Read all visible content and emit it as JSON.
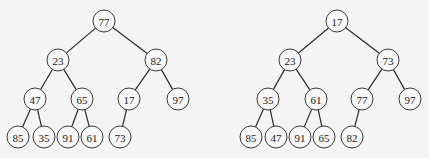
{
  "trees": [
    {
      "name": "left-tree",
      "nodes": [
        {
          "id": "a0",
          "value": "77",
          "x": 104,
          "y": 21
        },
        {
          "id": "a1",
          "value": "23",
          "x": 58,
          "y": 60
        },
        {
          "id": "a2",
          "value": "82",
          "x": 156,
          "y": 60
        },
        {
          "id": "a3",
          "value": "47",
          "x": 35,
          "y": 99
        },
        {
          "id": "a4",
          "value": "65",
          "x": 82,
          "y": 99
        },
        {
          "id": "a5",
          "value": "17",
          "x": 129,
          "y": 99
        },
        {
          "id": "a6",
          "value": "97",
          "x": 178,
          "y": 99
        },
        {
          "id": "a7",
          "value": "85",
          "x": 18,
          "y": 137
        },
        {
          "id": "a8",
          "value": "35",
          "x": 44,
          "y": 137
        },
        {
          "id": "a9",
          "value": "91",
          "x": 68,
          "y": 137
        },
        {
          "id": "a10",
          "value": "61",
          "x": 92,
          "y": 137
        },
        {
          "id": "a11",
          "value": "73",
          "x": 120,
          "y": 137
        }
      ],
      "edges": [
        [
          "a0",
          "a1"
        ],
        [
          "a0",
          "a2"
        ],
        [
          "a1",
          "a3"
        ],
        [
          "a1",
          "a4"
        ],
        [
          "a2",
          "a5"
        ],
        [
          "a2",
          "a6"
        ],
        [
          "a3",
          "a7"
        ],
        [
          "a3",
          "a8"
        ],
        [
          "a4",
          "a9"
        ],
        [
          "a4",
          "a10"
        ],
        [
          "a5",
          "a11"
        ]
      ]
    },
    {
      "name": "right-tree",
      "nodes": [
        {
          "id": "b0",
          "value": "17",
          "x": 337,
          "y": 21
        },
        {
          "id": "b1",
          "value": "23",
          "x": 290,
          "y": 60
        },
        {
          "id": "b2",
          "value": "73",
          "x": 388,
          "y": 60
        },
        {
          "id": "b3",
          "value": "35",
          "x": 268,
          "y": 99
        },
        {
          "id": "b4",
          "value": "61",
          "x": 316,
          "y": 99
        },
        {
          "id": "b5",
          "value": "77",
          "x": 362,
          "y": 99
        },
        {
          "id": "b6",
          "value": "97",
          "x": 410,
          "y": 99
        },
        {
          "id": "b7",
          "value": "85",
          "x": 251,
          "y": 137
        },
        {
          "id": "b8",
          "value": "47",
          "x": 276,
          "y": 137
        },
        {
          "id": "b9",
          "value": "91",
          "x": 300,
          "y": 137
        },
        {
          "id": "b10",
          "value": "65",
          "x": 324,
          "y": 137
        },
        {
          "id": "b11",
          "value": "82",
          "x": 352,
          "y": 137
        }
      ],
      "edges": [
        [
          "b0",
          "b1"
        ],
        [
          "b0",
          "b2"
        ],
        [
          "b1",
          "b3"
        ],
        [
          "b1",
          "b4"
        ],
        [
          "b2",
          "b5"
        ],
        [
          "b2",
          "b6"
        ],
        [
          "b3",
          "b7"
        ],
        [
          "b3",
          "b8"
        ],
        [
          "b4",
          "b9"
        ],
        [
          "b4",
          "b10"
        ],
        [
          "b5",
          "b11"
        ]
      ]
    }
  ],
  "style": {
    "node_radius": 11
  }
}
